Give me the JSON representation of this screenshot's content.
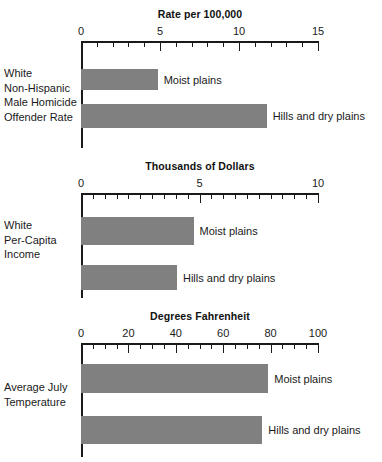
{
  "chart_data": [
    {
      "type": "bar",
      "orientation": "horizontal",
      "title": "Rate per 100,000",
      "category_label": "White\nNon-Hispanic\nMale Homicide\nOffender Rate",
      "xlabel": "",
      "ylabel": "",
      "xlim": [
        0,
        15
      ],
      "grid": false,
      "legend": "none",
      "tick_labels": [
        "0",
        "5",
        "10",
        "15"
      ],
      "tick_values": [
        0,
        5,
        10,
        15
      ],
      "minor_ticks_per_major": 5,
      "categories": [
        "Moist plains",
        "Hills and dry plains"
      ],
      "values": [
        4.85,
        11.75
      ],
      "bar_color": "#808080"
    },
    {
      "type": "bar",
      "orientation": "horizontal",
      "title": "Thousands of Dollars",
      "category_label": "White\nPer-Capita\nIncome",
      "xlabel": "",
      "ylabel": "",
      "xlim": [
        0,
        10
      ],
      "grid": false,
      "legend": "none",
      "tick_labels": [
        "0",
        "5",
        "10"
      ],
      "tick_values": [
        0,
        5,
        10
      ],
      "minor_ticks_per_major": 10,
      "categories": [
        "Moist plains",
        "Hills and dry plains"
      ],
      "values": [
        4.75,
        4.05
      ],
      "bar_color": "#808080"
    },
    {
      "type": "bar",
      "orientation": "horizontal",
      "title": "Degrees Fahrenheit",
      "category_label": "Average July\nTemperature",
      "xlabel": "",
      "ylabel": "",
      "xlim": [
        0,
        100
      ],
      "grid": false,
      "legend": "none",
      "tick_labels": [
        "0",
        "20",
        "40",
        "60",
        "80",
        "100"
      ],
      "tick_values": [
        0,
        20,
        40,
        60,
        80,
        100
      ],
      "minor_ticks_per_major": 4,
      "categories": [
        "Moist plains",
        "Hills and dry plains"
      ],
      "values": [
        79,
        76.5
      ],
      "bar_color": "#808080"
    }
  ],
  "panels": [
    {
      "title": "Rate per 100,000",
      "category_label": "White\nNon-Hispanic\nMale Homicide\nOffender Rate",
      "ticks": [
        "0",
        "5",
        "10",
        "15"
      ],
      "bars": [
        {
          "label": "Moist plains",
          "value": 4.85
        },
        {
          "label": "Hills and dry plains",
          "value": 11.75
        }
      ]
    },
    {
      "title": "Thousands of Dollars",
      "category_label": "White\nPer-Capita\nIncome",
      "ticks": [
        "0",
        "5",
        "10"
      ],
      "bars": [
        {
          "label": "Moist plains",
          "value": 4.75
        },
        {
          "label": "Hills and dry plains",
          "value": 4.05
        }
      ]
    },
    {
      "title": "Degrees Fahrenheit",
      "category_label": "Average July\nTemperature",
      "ticks": [
        "0",
        "20",
        "40",
        "60",
        "80",
        "100"
      ],
      "bars": [
        {
          "label": "Moist plains",
          "value": 79
        },
        {
          "label": "Hills and dry plains",
          "value": 76.5
        }
      ]
    }
  ]
}
